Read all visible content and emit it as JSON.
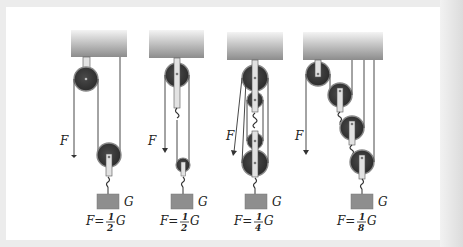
{
  "diagram": {
    "type": "pulley-systems",
    "force_label": "F",
    "weight_label": "G",
    "systems": [
      {
        "name": "single-movable-pulley",
        "formula_prefix": "F=",
        "numerator": "1",
        "denominator": "2",
        "suffix": "G"
      },
      {
        "name": "fixed-plus-movable-pulley",
        "formula_prefix": "F=",
        "numerator": "1",
        "denominator": "2",
        "suffix": "G"
      },
      {
        "name": "block-and-tackle",
        "formula_prefix": "F=",
        "numerator": "1",
        "denominator": "4",
        "suffix": "G"
      },
      {
        "name": "compound-pulley-chain",
        "formula_prefix": "F=",
        "numerator": "1",
        "denominator": "8",
        "suffix": "G"
      }
    ]
  },
  "colors": {
    "background": "#ffffff",
    "frame": "#e6e6e6",
    "ceiling_top": "#f4f4f4",
    "ceiling_bottom": "#8c8c8c",
    "pulley": "#3a3a3a",
    "pulley_rim": "#8a8a8a",
    "weight": "#8e8e8e",
    "rope": "#333333",
    "strap": "#e2e2e2"
  }
}
